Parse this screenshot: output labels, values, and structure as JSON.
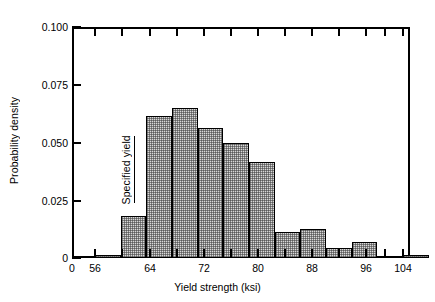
{
  "chart_data": {
    "type": "bar",
    "title": "",
    "subtitle": "",
    "xlabel": "Yield strength (ksi)",
    "ylabel": "Probability density",
    "xlim": [
      54,
      108
    ],
    "ylim": [
      0,
      0.1
    ],
    "grid": false,
    "legend": null,
    "x_ticks": [
      {
        "value": 0,
        "label": "0",
        "px": 72
      },
      {
        "value": 56,
        "label": "56",
        "px": 95
      },
      {
        "value": 64,
        "label": "64",
        "px": 150
      },
      {
        "value": 72,
        "label": "72",
        "px": 204
      },
      {
        "value": 80,
        "label": "80",
        "px": 258
      },
      {
        "value": 88,
        "label": "88",
        "px": 312
      },
      {
        "value": 96,
        "label": "96",
        "px": 366
      },
      {
        "value": 104,
        "label": "104",
        "px": 403
      }
    ],
    "x_minor_ticks_px": [
      122,
      177,
      231,
      285,
      339,
      385
    ],
    "y_ticks": [
      {
        "value": 0.1,
        "label": "0.100",
        "px": 27
      },
      {
        "value": 0.075,
        "label": "0.075",
        "px": 85
      },
      {
        "value": 0.05,
        "label": "0.050",
        "px": 143
      },
      {
        "value": 0.025,
        "label": "0.025",
        "px": 201
      },
      {
        "value": 0,
        "label": "0",
        "px": 258
      }
    ],
    "bin_width": 4,
    "bins": [
      {
        "x0": 56,
        "x1": 60,
        "value": 0.0015,
        "label": "56-60"
      },
      {
        "x0": 60,
        "x1": 64,
        "value": 0.018,
        "label": "60-64"
      },
      {
        "x0": 64,
        "x1": 68,
        "value": 0.0615,
        "label": "64-68"
      },
      {
        "x0": 68,
        "x1": 72,
        "value": 0.065,
        "label": "68-72"
      },
      {
        "x0": 72,
        "x1": 76,
        "value": 0.0562,
        "label": "72-76"
      },
      {
        "x0": 76,
        "x1": 80,
        "value": 0.0497,
        "label": "76-80"
      },
      {
        "x0": 80,
        "x1": 84,
        "value": 0.0415,
        "label": "80-84"
      },
      {
        "x0": 84,
        "x1": 88,
        "value": 0.0112,
        "label": "84-88"
      },
      {
        "x0": 88,
        "x1": 92,
        "value": 0.0125,
        "label": "88-92"
      },
      {
        "x0": 92,
        "x1": 96,
        "value": 0.0042,
        "label": "92-96"
      },
      {
        "x0": 96,
        "x1": 100,
        "value": 0.0068,
        "label": "96-100"
      },
      {
        "x0": 104,
        "x1": 108,
        "value": 0.0015,
        "label": "104-108"
      }
    ],
    "annotations": [
      {
        "name": "specified-yield",
        "text": "Specified yield",
        "x_value": 62,
        "y_from": 0.0238,
        "y_to": 0.053,
        "orientation": "vertical"
      }
    ],
    "colors": {
      "axis": "#000000",
      "bar_fill": "#d8d8d8",
      "bar_edge": "#000000",
      "background": "#ffffff",
      "text": "#000000"
    }
  }
}
